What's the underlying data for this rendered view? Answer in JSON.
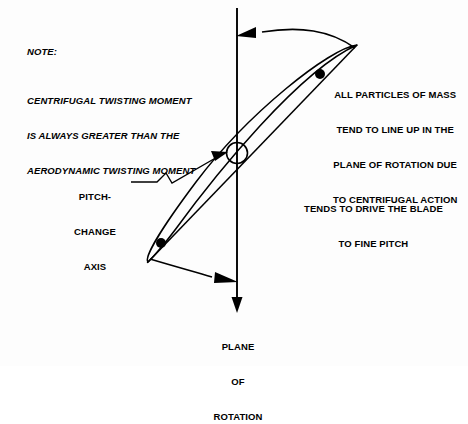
{
  "figure": {
    "line_color": "#000000",
    "background_color": "#ffffff"
  },
  "note": {
    "heading": "NOTE:",
    "body_lines": [
      "CENTRIFUGAL TWISTING MOMENT",
      "IS ALWAYS GREATER THAN THE",
      "AERODYNAMIC TWISTING MOMENT"
    ]
  },
  "annotations": {
    "particles": [
      "ALL PARTICLES OF MASS",
      "TEND TO LINE UP IN THE",
      "PLANE OF ROTATION DUE",
      "TO CENTRIFUGAL ACTION"
    ],
    "fine_pitch": [
      "TENDS TO DRIVE THE BLADE",
      "TO FINE PITCH"
    ],
    "pitch_change_axis": [
      "PITCH-",
      "CHANGE",
      "AXIS"
    ],
    "plane_of_rotation": [
      "PLANE",
      "OF",
      "ROTATION"
    ]
  },
  "geometry": {
    "rotation_axis": {
      "x": 237,
      "y_top": 8,
      "y_bottom": 312
    },
    "blade_chord": {
      "x1": 148,
      "y1": 262,
      "x2": 357,
      "y2": 45
    },
    "pitch_change_point": {
      "cx": 237,
      "cy": 153,
      "r": 10.5
    },
    "mass_particles": [
      {
        "cx": 320,
        "cy": 74,
        "r": 5
      },
      {
        "cx": 161,
        "cy": 243,
        "r": 5
      }
    ],
    "upper_arrow_tip": {
      "x": 240,
      "y": 36
    },
    "lower_arrow_tip": {
      "x": 236,
      "y": 281
    }
  }
}
